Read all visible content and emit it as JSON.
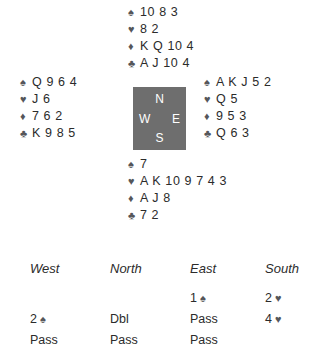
{
  "diagram": {
    "type": "bridge-hand-diagram",
    "suit_symbols": {
      "spade": "♠",
      "heart": "♥",
      "diamond": "♦",
      "club": "♣"
    },
    "symbol_color": "#55565a",
    "text_color": "#2b2b2b",
    "compass_box_color": "#6e6e6e",
    "compass_label_color": "#ffffff"
  },
  "compass": {
    "north": "N",
    "east": "E",
    "south": "S",
    "west": "W"
  },
  "hands": {
    "north": {
      "position": "North",
      "spades": "10 8 3",
      "hearts": "8 2",
      "diamonds": "K Q 10 4",
      "clubs": "A J 10 4"
    },
    "west": {
      "position": "West",
      "spades": "Q 9 6 4",
      "hearts": "J 6",
      "diamonds": "7 6 2",
      "clubs": "K 9 8 5"
    },
    "east": {
      "position": "East",
      "spades": "A K J 5 2",
      "hearts": "Q 5",
      "diamonds": "9 5 3",
      "clubs": "Q 6 3"
    },
    "south": {
      "position": "South",
      "spades": "7",
      "hearts": "A K 10 9 7 4 3",
      "diamonds": "A J 8",
      "clubs": "7 2"
    }
  },
  "auction": {
    "headers": [
      "West",
      "North",
      "East",
      "South"
    ],
    "rows": [
      [
        {
          "level": "",
          "suit": ""
        },
        {
          "level": "",
          "suit": ""
        },
        {
          "level": "1",
          "suit": "♠"
        },
        {
          "level": "2",
          "suit": "♥"
        }
      ],
      [
        {
          "level": "2",
          "suit": "♠"
        },
        {
          "level": "Dbl",
          "suit": ""
        },
        {
          "level": "Pass",
          "suit": ""
        },
        {
          "level": "4",
          "suit": "♥"
        }
      ],
      [
        {
          "level": "Pass",
          "suit": ""
        },
        {
          "level": "Pass",
          "suit": ""
        },
        {
          "level": "Pass",
          "suit": ""
        },
        {
          "level": "",
          "suit": ""
        }
      ]
    ]
  }
}
